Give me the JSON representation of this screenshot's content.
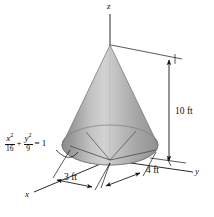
{
  "figure": {
    "background_color": "#ffffff",
    "line_color": "#111111",
    "cone": {
      "fill_light": "#cfcfcf",
      "fill_mid": "#a9a9a9",
      "fill_dark": "#8a8a8a",
      "base_fill": "#b5b5b5",
      "apex": {
        "x": 110,
        "y": 45
      },
      "base_center": {
        "x": 110,
        "y": 145
      },
      "base_rx": 48,
      "base_ry": 20
    }
  },
  "axes": {
    "z_label": "z",
    "y_label": "y",
    "x_label": "x"
  },
  "dimensions": {
    "height_label": "10 ft",
    "semi_axis_x_label": "3 ft",
    "semi_axis_y_label": "4 ft"
  },
  "equation": {
    "term1_numerator": "x",
    "term1_numerator_exponent": "2",
    "term1_denominator": "16",
    "operator": "+",
    "term2_numerator": "y",
    "term2_numerator_exponent": "2",
    "term2_denominator": "9",
    "equals": "=",
    "right_hand_side": "1",
    "full_text": "x^2/16 + y^2/9 = 1"
  }
}
